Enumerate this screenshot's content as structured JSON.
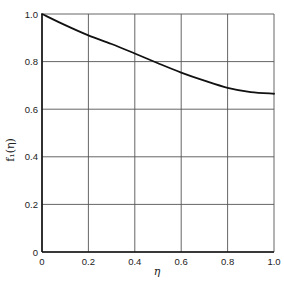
{
  "chart_data": {
    "type": "line",
    "title": "",
    "xlabel": "η",
    "ylabel": "f₁(η)",
    "xlim": [
      0,
      1.0
    ],
    "ylim": [
      0,
      1.0
    ],
    "grid": true,
    "legend": null,
    "x_ticks": [
      "0",
      "0.2",
      "0.4",
      "0.6",
      "0.8",
      "1.0"
    ],
    "y_ticks": [
      "0",
      "0.2",
      "0.4",
      "0.6",
      "0.8",
      "1.0"
    ],
    "series": [
      {
        "name": "f1(eta)",
        "x": [
          0.0,
          0.1,
          0.2,
          0.3,
          0.4,
          0.5,
          0.6,
          0.7,
          0.8,
          0.9,
          1.0
        ],
        "values": [
          1.0,
          0.953,
          0.91,
          0.874,
          0.834,
          0.793,
          0.754,
          0.72,
          0.69,
          0.672,
          0.665
        ]
      }
    ]
  },
  "colors": {
    "line": "#111111",
    "grid": "#555555",
    "background": "#ffffff"
  }
}
